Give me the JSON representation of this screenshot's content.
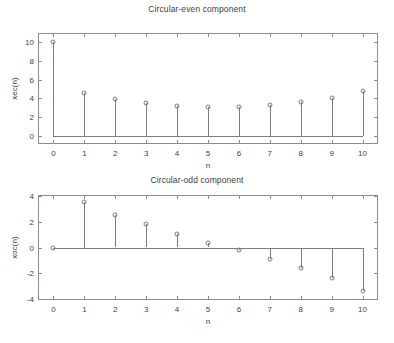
{
  "figure": {
    "background": "#ffffff",
    "line_color": "#7c7c7c",
    "axis_color": "#8d8d8d",
    "text_color": "#3f3f3f"
  },
  "chart_data": [
    {
      "type": "scatter",
      "plot_style": "stem",
      "title": "Circular-even component",
      "xlabel": "n",
      "ylabel": "xec(n)",
      "x": [
        0,
        1,
        2,
        3,
        4,
        5,
        6,
        7,
        8,
        9,
        10
      ],
      "values": [
        10.0,
        4.6,
        3.95,
        3.5,
        3.2,
        3.05,
        3.05,
        3.25,
        3.6,
        4.05,
        4.75
      ],
      "xlim": [
        -0.5,
        10.5
      ],
      "ylim": [
        -0.6,
        11.2
      ],
      "xticks": [
        0,
        1,
        2,
        3,
        4,
        5,
        6,
        7,
        8,
        9,
        10
      ],
      "yticks": [
        0,
        2,
        4,
        6,
        8,
        10
      ],
      "xtick_labels": [
        "0",
        "1",
        "2",
        "3",
        "4",
        "5",
        "6",
        "7",
        "8",
        "9",
        "10"
      ],
      "ytick_labels": [
        "0",
        "2",
        "4",
        "6",
        "8",
        "10"
      ],
      "grid": false,
      "legend": null,
      "baseline": 0
    },
    {
      "type": "scatter",
      "plot_style": "stem",
      "title": "Circular-odd component",
      "xlabel": "n",
      "ylabel": "xoc(n)",
      "x": [
        0,
        1,
        2,
        3,
        4,
        5,
        6,
        7,
        8,
        9,
        10
      ],
      "values": [
        0.0,
        3.5,
        2.55,
        1.8,
        1.05,
        0.35,
        -0.2,
        -0.9,
        -1.6,
        -2.4,
        -3.35
      ],
      "xlim": [
        -0.5,
        10.5
      ],
      "ylim": [
        -4.0,
        4.0
      ],
      "xticks": [
        0,
        1,
        2,
        3,
        4,
        5,
        6,
        7,
        8,
        9,
        10
      ],
      "yticks": [
        -4,
        -2,
        0,
        2,
        4
      ],
      "xtick_labels": [
        "0",
        "1",
        "2",
        "3",
        "4",
        "5",
        "6",
        "7",
        "8",
        "9",
        "10"
      ],
      "ytick_labels": [
        "-4",
        "-2",
        "0",
        "2",
        "4"
      ],
      "grid": false,
      "legend": null,
      "baseline": 0
    }
  ]
}
